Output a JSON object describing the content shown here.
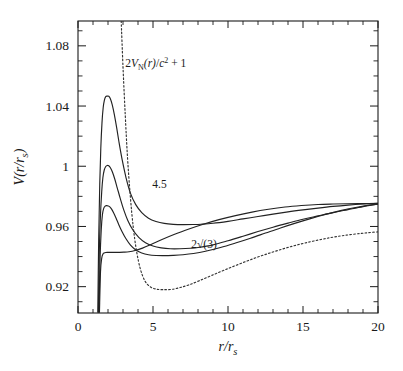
{
  "chart_data": {
    "type": "line",
    "title": "",
    "xlabel": "r/r_s",
    "ylabel": "V(r/r_s)",
    "xlim": [
      0,
      20
    ],
    "ylim": [
      0.9025,
      1.0965
    ],
    "grid": false,
    "legend": "none",
    "xticks": [
      0,
      5,
      10,
      15,
      20
    ],
    "xticklabels": [
      "0",
      "5",
      "10",
      "15",
      "20"
    ],
    "xminor_step": 1,
    "yticks": [
      0.92,
      0.96,
      1,
      1.04,
      1.08
    ],
    "yticklabels": [
      "0.92",
      "0.96",
      "1",
      "1.04",
      "1.08"
    ],
    "yminor_step": 0.01,
    "annotations": [
      {
        "text": "2V_N(r)/c² + 1",
        "x": 3.15,
        "y": 1.066,
        "name": "newtonian-potential-label"
      },
      {
        "text": "4.5",
        "x": 4.95,
        "y": 0.9855,
        "name": "curve-label-4point5"
      },
      {
        "text": "2√(3)",
        "x": 7.55,
        "y": 0.9455,
        "name": "curve-label-2sqrt3"
      }
    ],
    "series": [
      {
        "name": "L = 4.5",
        "style": "solid",
        "label": "4.5",
        "peak": {
          "x": 2.05,
          "y": 1.0465
        },
        "minimum": {
          "x": 8.2,
          "y": 0.9715
        },
        "x": [
          1.32,
          1.38,
          1.45,
          1.52,
          1.6,
          1.68,
          1.76,
          1.85,
          1.95,
          2.05,
          2.15,
          2.28,
          2.42,
          2.58,
          2.75,
          2.95,
          3.2,
          3.5,
          3.85,
          4.25,
          4.7,
          5.2,
          5.75,
          6.35,
          7.0,
          7.7,
          8.2,
          9.0,
          10.0,
          11.0,
          12.0,
          13.0,
          14.0,
          15.0,
          16.0,
          17.0,
          18.0,
          19.0,
          20.0
        ],
        "y": [
          0.903,
          0.952,
          0.988,
          1.012,
          1.029,
          1.039,
          1.044,
          1.0463,
          1.0466,
          1.0465,
          1.045,
          1.041,
          1.0345,
          1.0255,
          1.015,
          1.004,
          0.9925,
          0.982,
          0.9745,
          0.9692,
          0.9655,
          0.9633,
          0.962,
          0.9614,
          0.9612,
          0.9613,
          0.9615,
          0.9621,
          0.9634,
          0.965,
          0.9666,
          0.9682,
          0.9697,
          0.971,
          0.9722,
          0.9733,
          0.9742,
          0.9749,
          0.9754
        ]
      },
      {
        "name": "L = 4.2",
        "style": "solid",
        "peak": {
          "x": 2.05,
          "y": 1.0005
        },
        "minimum": {
          "x": 8.0,
          "y": 0.9595
        },
        "x": [
          1.36,
          1.42,
          1.5,
          1.58,
          1.66,
          1.75,
          1.85,
          1.95,
          2.05,
          2.16,
          2.3,
          2.45,
          2.62,
          2.82,
          3.05,
          3.32,
          3.65,
          4.05,
          4.5,
          5.0,
          5.55,
          6.15,
          6.8,
          7.5,
          8.0,
          9.0,
          10.0,
          11.0,
          12.0,
          13.0,
          14.0,
          15.0,
          16.0,
          17.0,
          18.0,
          19.0,
          20.0
        ],
        "y": [
          0.903,
          0.943,
          0.968,
          0.983,
          0.9925,
          0.9975,
          0.9998,
          1.0005,
          1.0003,
          0.999,
          0.996,
          0.9915,
          0.9855,
          0.9785,
          0.971,
          0.964,
          0.9578,
          0.9528,
          0.9492,
          0.947,
          0.9458,
          0.9452,
          0.9452,
          0.9455,
          0.946,
          0.9478,
          0.9505,
          0.9535,
          0.9566,
          0.9595,
          0.9622,
          0.9648,
          0.967,
          0.9692,
          0.9712,
          0.9732,
          0.975
        ]
      },
      {
        "name": "L = 4.0",
        "style": "solid",
        "peak": {
          "x": 2.1,
          "y": 0.9735
        },
        "minimum": {
          "x": 7.0,
          "y": 0.947
        },
        "x": [
          1.4,
          1.47,
          1.55,
          1.63,
          1.72,
          1.82,
          1.92,
          2.02,
          2.12,
          2.24,
          2.38,
          2.54,
          2.72,
          2.94,
          3.2,
          3.5,
          3.85,
          4.25,
          4.7,
          5.2,
          5.75,
          6.35,
          7.0,
          7.7,
          8.5,
          9.5,
          10.5,
          11.5,
          12.5,
          13.5,
          14.5,
          15.5,
          16.5,
          17.5,
          18.5,
          19.3,
          20.0
        ],
        "y": [
          0.903,
          0.938,
          0.958,
          0.968,
          0.9722,
          0.9736,
          0.9738,
          0.9736,
          0.973,
          0.9715,
          0.969,
          0.9655,
          0.9612,
          0.9565,
          0.9518,
          0.9476,
          0.9444,
          0.9424,
          0.9412,
          0.9407,
          0.9406,
          0.9408,
          0.9412,
          0.942,
          0.9435,
          0.946,
          0.949,
          0.9522,
          0.9556,
          0.959,
          0.9622,
          0.9652,
          0.968,
          0.9705,
          0.9726,
          0.974,
          0.9748
        ]
      },
      {
        "name": "2sqrt(3)",
        "style": "solid",
        "label": "2√(3)",
        "inflection": {
          "x": 2.6,
          "y": 0.9425
        },
        "x": [
          1.43,
          1.5,
          1.58,
          1.66,
          1.75,
          1.85,
          1.96,
          2.08,
          2.22,
          2.38,
          2.56,
          2.78,
          3.05,
          3.4,
          3.8,
          4.3,
          4.9,
          5.6,
          6.4,
          7.3,
          8.3,
          9.4,
          10.5,
          11.6,
          12.7,
          13.8,
          14.9,
          16.0,
          17.0,
          18.0,
          19.0,
          20.0
        ],
        "y": [
          0.903,
          0.93,
          0.9388,
          0.9416,
          0.9424,
          0.9427,
          0.9428,
          0.9428,
          0.9428,
          0.9428,
          0.9428,
          0.9428,
          0.9429,
          0.9432,
          0.944,
          0.9456,
          0.9482,
          0.9513,
          0.9546,
          0.958,
          0.9613,
          0.9645,
          0.9672,
          0.9695,
          0.9714,
          0.9729,
          0.9739,
          0.9746,
          0.9749,
          0.9751,
          0.9752,
          0.9753
        ]
      },
      {
        "name": "2V_N(r)/c^2 + 1",
        "style": "dotted",
        "label": "2V_N(r)/c² + 1",
        "minimum": {
          "x": 6.25,
          "y": 0.9182
        },
        "x": [
          2.88,
          3.0,
          3.15,
          3.3,
          3.48,
          3.68,
          3.9,
          4.15,
          4.45,
          4.8,
          5.2,
          5.65,
          6.25,
          6.8,
          7.4,
          8.1,
          8.9,
          9.8,
          10.8,
          11.8,
          12.8,
          13.8,
          14.8,
          15.8,
          16.8,
          17.8,
          18.8,
          19.5,
          20.0
        ],
        "y": [
          1.0965,
          1.066,
          1.034,
          1.006,
          0.981,
          0.9598,
          0.9438,
          0.932,
          0.924,
          0.92,
          0.9184,
          0.918,
          0.9182,
          0.9194,
          0.9212,
          0.924,
          0.9274,
          0.9312,
          0.9352,
          0.939,
          0.9424,
          0.9455,
          0.9482,
          0.9505,
          0.9525,
          0.9541,
          0.9553,
          0.956,
          0.9564
        ]
      }
    ]
  },
  "axes": {
    "xlabel_display": "r/r",
    "xlabel_sub": "s",
    "ylabel_display": "V(r/r",
    "ylabel_sub": "s",
    "ylabel_close": ")"
  },
  "colors": {
    "ink": "#1a1a1a",
    "curve": "#222222",
    "background": "#ffffff"
  }
}
